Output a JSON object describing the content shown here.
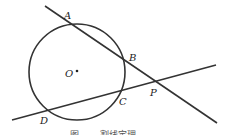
{
  "diagram": {
    "circle": {
      "cx": 77,
      "cy": 72,
      "r": 48,
      "center_label": "O"
    },
    "points": [
      {
        "name": "A",
        "x": 68,
        "y": 22,
        "lx": 64,
        "ly": 19
      },
      {
        "name": "B",
        "x": 125,
        "y": 62,
        "lx": 129,
        "ly": 61
      },
      {
        "name": "C",
        "x": 122,
        "y": 91,
        "lx": 119,
        "ly": 105
      },
      {
        "name": "D",
        "x": 48,
        "y": 110,
        "lx": 40,
        "ly": 124
      },
      {
        "name": "P",
        "x": 155,
        "y": 82,
        "lx": 150,
        "ly": 96
      }
    ],
    "lines": [
      {
        "name": "secant-PBA",
        "x1": 45,
        "y1": 6,
        "x2": 217,
        "y2": 123
      },
      {
        "name": "secant-PCD",
        "x1": 12,
        "y1": 120,
        "x2": 216,
        "y2": 65
      }
    ],
    "caption": "图……  割线定理"
  }
}
